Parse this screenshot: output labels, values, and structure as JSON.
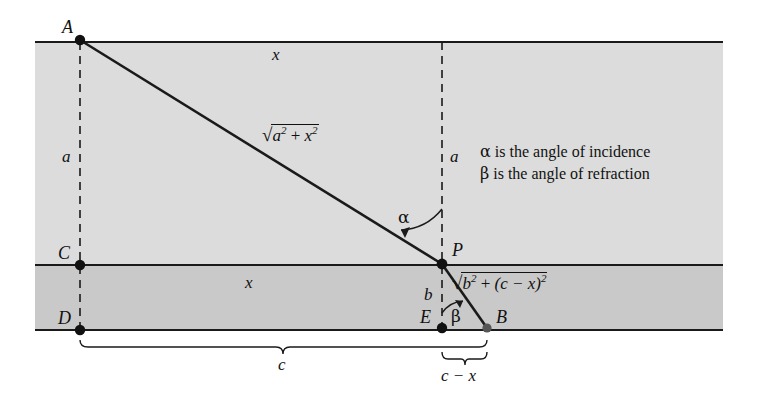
{
  "figure": {
    "background": "#ffffff",
    "bands": {
      "upper_fill": "#dcdcdc",
      "lower_fill": "#c9c9c9",
      "line_color": "#1a1a1a"
    },
    "points": [
      {
        "name": "A",
        "label": "A",
        "x": 80,
        "y": 40,
        "label_x": 62,
        "label_y": 18
      },
      {
        "name": "C",
        "label": "C",
        "x": 80,
        "y": 265,
        "label_x": 58,
        "label_y": 244
      },
      {
        "name": "D",
        "label": "D",
        "x": 80,
        "y": 330,
        "label_x": 58,
        "label_y": 309
      },
      {
        "name": "P",
        "label": "P",
        "x": 442,
        "y": 264,
        "label_x": 452,
        "label_y": 241
      },
      {
        "name": "E",
        "label": "E",
        "x": 442,
        "y": 328,
        "label_x": 420,
        "label_y": 308
      },
      {
        "name": "B",
        "label": "B",
        "x": 487,
        "y": 328,
        "label_x": 496,
        "label_y": 308
      }
    ],
    "segment_labels": {
      "x_top": "x",
      "x_middle": "x",
      "a_left": "a",
      "a_right": "a",
      "b": "b",
      "c": "c",
      "c_minus_x": "c − x"
    },
    "angles": {
      "alpha": "α",
      "beta": "β"
    },
    "formulas": {
      "incident": {
        "radicand_main": "a",
        "plus": "+",
        "radicand_second": "x",
        "exp": "2"
      },
      "refracted": {
        "radicand_main": "b",
        "plus": "+",
        "radicand_second": "(c − x)",
        "exp": "2"
      },
      "incident_plain": "√(a² + x²)",
      "refracted_plain": "√(b² + (c − x)²)"
    },
    "legend": {
      "line1": "α is the angle of incidence",
      "line2": "β is the angle of refraction",
      "line1_symbol": "α",
      "line1_text": " is the angle of incidence",
      "line2_symbol": "β",
      "line2_text": " is the angle of refraction"
    }
  }
}
